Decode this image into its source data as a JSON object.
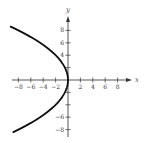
{
  "chart_data": {
    "type": "line",
    "title": "",
    "xlabel": "x",
    "ylabel": "y",
    "xlim": [
      -9,
      10
    ],
    "ylim": [
      -9,
      10
    ],
    "grid": false,
    "legend": null,
    "x_ticks": [
      -8,
      -6,
      -4,
      -2,
      2,
      4,
      6,
      8
    ],
    "x_tick_labels": [
      "−8",
      "−6",
      "−4",
      "−2",
      "2",
      "4",
      "6",
      "8"
    ],
    "y_ticks": [
      8,
      6,
      4,
      2,
      -2,
      -4,
      -6,
      -8
    ],
    "y_tick_labels": [
      "8",
      "6",
      "4",
      "",
      "",
      "",
      "−6",
      "−8"
    ],
    "series": [
      {
        "name": "parabola opening left (x = -y^2/8)",
        "color": "#111111",
        "points": [
          {
            "x": -9.0,
            "y": 8.5
          },
          {
            "x": -8.0,
            "y": 8.0
          },
          {
            "x": -4.5,
            "y": 6.0
          },
          {
            "x": -2.0,
            "y": 4.0
          },
          {
            "x": -0.5,
            "y": 2.0
          },
          {
            "x": 0.0,
            "y": 0.0
          },
          {
            "x": -0.5,
            "y": -2.0
          },
          {
            "x": -2.0,
            "y": -4.0
          },
          {
            "x": -4.5,
            "y": -6.0
          },
          {
            "x": -8.0,
            "y": -8.0
          },
          {
            "x": -9.0,
            "y": -8.5
          }
        ]
      }
    ]
  },
  "axes": {
    "x_label": "x",
    "y_label": "y"
  }
}
